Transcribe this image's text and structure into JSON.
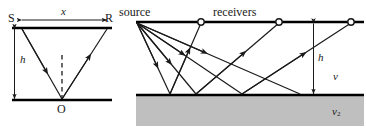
{
  "figure": {
    "title": "",
    "panels": [
      {
        "id": "left-panel",
        "name": "normal-incidence-reflection-diagram",
        "labels": {
          "source_point": "S",
          "receiver_point": "R",
          "offset": "x",
          "depth": "h",
          "reflection_point": "O"
        }
      },
      {
        "id": "right-panel",
        "name": "common-source-multichannel-reflection-diagram",
        "labels": {
          "source": "source",
          "receivers": "receivers",
          "depth": "h",
          "layer1_velocity": "v",
          "layer2_velocity_base": "v",
          "layer2_velocity_sub": "2"
        }
      }
    ]
  },
  "colors": {
    "ink": "#1a1a1a",
    "line": "#000000",
    "halfspace_fill": "#bfbfbf",
    "halfspace_stroke": "#9a9a9a",
    "background": "#ffffff"
  },
  "geometry": {
    "left": {
      "surface_y": 28,
      "reflector_y": 100,
      "x_left": 12,
      "x_right": 112,
      "S_x": 22,
      "R_x": 107,
      "O_x": 62,
      "h_arrow_x": 14,
      "x_arrow_y": 20
    },
    "right": {
      "surface_y": 22,
      "interface_y": 95,
      "x_left": 136,
      "x_right": 364,
      "source_x": 137,
      "receiver_x": [
        201,
        279,
        351
      ],
      "bounce_x": [
        170,
        196,
        242,
        300
      ],
      "h_arrow_x": 313,
      "halfspace_bottom": 126
    }
  }
}
